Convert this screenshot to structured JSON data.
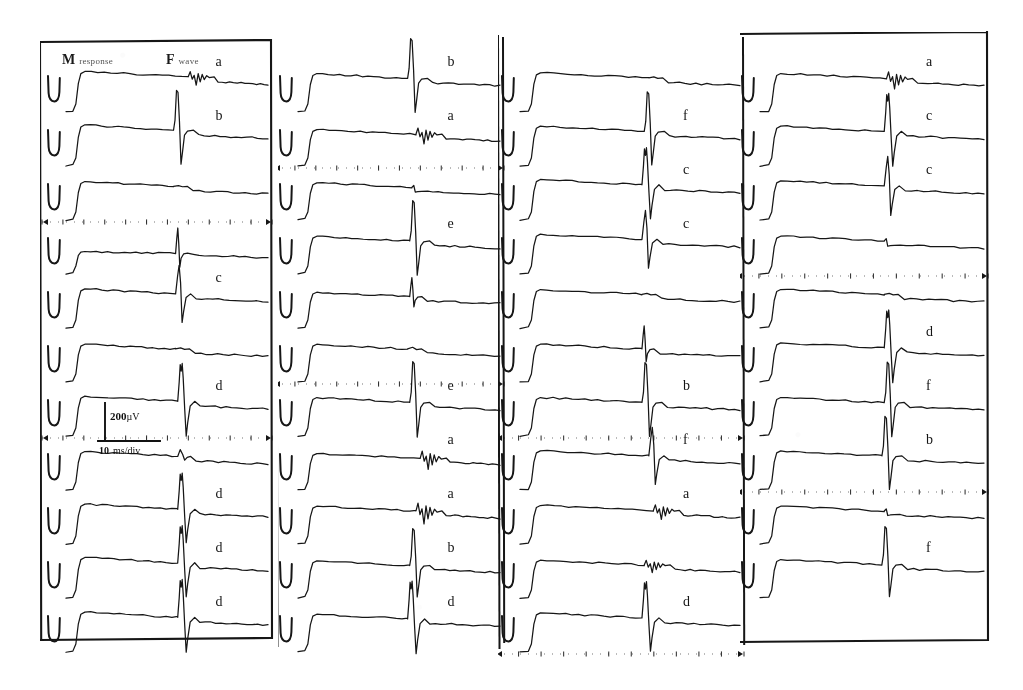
{
  "figure": {
    "background_color": "#ffffff",
    "trace_color": "#161616",
    "width": 1023,
    "height": 690
  },
  "header": {
    "m_label_bold": "M",
    "m_label_small": "response",
    "f_label_bold": "F",
    "f_label_small": "wave"
  },
  "calibration": {
    "vertical_value": "200",
    "vertical_unit": "µV",
    "horizontal_value": "10",
    "horizontal_unit": "ms/div"
  },
  "chart_data": {
    "type": "line",
    "subtitle": "Four panels of stacked surface EMG sweeps; each sweep shows a stimulus artifact, an M response plateau and a later F wave deflection.",
    "xlabel": "Time",
    "ylabel": "Amplitude",
    "xunit": "ms",
    "yunit": "µV",
    "x_scale_per_div": 10,
    "y_scale_bar": 200,
    "grid": "dotted-timebase-rows",
    "legend": "none",
    "annotations": [
      "M response",
      "F wave"
    ],
    "panels": [
      {
        "index": 1,
        "border": "full-box",
        "n_traces": 11,
        "timebase_rows": [
          2,
          6
        ],
        "traces": [
          {
            "label": "a",
            "f_wave": "polyphasic-small",
            "f_amp": 0.22,
            "f_pos": 0.62,
            "m_amp": 0.78
          },
          {
            "label": "b",
            "f_wave": "large-biphasic",
            "f_amp": 0.95,
            "f_pos": 0.55,
            "m_amp": 0.8
          },
          {
            "label": "",
            "f_wave": "flat",
            "f_amp": 0.04,
            "f_pos": 0.55,
            "m_amp": 0.72
          },
          {
            "label": "",
            "f_wave": "spike-narrow",
            "f_amp": 0.6,
            "f_pos": 0.56,
            "m_amp": 0.25
          },
          {
            "label": "c",
            "f_wave": "biphasic",
            "f_amp": 0.85,
            "f_pos": 0.56,
            "m_amp": 0.74
          },
          {
            "label": "",
            "f_wave": "flat",
            "f_amp": 0.05,
            "f_pos": 0.56,
            "m_amp": 0.7
          },
          {
            "label": "d",
            "f_wave": "notched-biphasic",
            "f_amp": 0.92,
            "f_pos": 0.57,
            "m_amp": 0.76
          },
          {
            "label": "",
            "f_wave": "small-bump",
            "f_amp": 0.18,
            "f_pos": 0.57,
            "m_amp": 0.72
          },
          {
            "label": "d",
            "f_wave": "notched-biphasic",
            "f_amp": 0.88,
            "f_pos": 0.57,
            "m_amp": 0.76
          },
          {
            "label": "d",
            "f_wave": "notched-biphasic",
            "f_amp": 0.9,
            "f_pos": 0.57,
            "m_amp": 0.78
          },
          {
            "label": "d",
            "f_wave": "notched-biphasic",
            "f_amp": 0.92,
            "f_pos": 0.57,
            "m_amp": 0.76
          }
        ]
      },
      {
        "index": 2,
        "border": "left-right-rules",
        "n_traces": 11,
        "timebase_rows": [
          1,
          5
        ],
        "traces": [
          {
            "label": "b",
            "f_wave": "large-biphasic",
            "f_amp": 0.95,
            "f_pos": 0.56,
            "m_amp": 0.72
          },
          {
            "label": "a",
            "f_wave": "polyphasic-small",
            "f_amp": 0.26,
            "f_pos": 0.6,
            "m_amp": 0.66
          },
          {
            "label": "",
            "f_wave": "step-down",
            "f_amp": 0.12,
            "f_pos": 0.58,
            "m_amp": 0.68
          },
          {
            "label": "e",
            "f_wave": "large-biphasic",
            "f_amp": 0.96,
            "f_pos": 0.57,
            "m_amp": 0.7
          },
          {
            "label": "",
            "f_wave": "spike-narrow",
            "f_amp": 0.45,
            "f_pos": 0.57,
            "m_amp": 0.64
          },
          {
            "label": "",
            "f_wave": "flat",
            "f_amp": 0.08,
            "f_pos": 0.56,
            "m_amp": 0.7
          },
          {
            "label": "e",
            "f_wave": "large-biphasic",
            "f_amp": 0.97,
            "f_pos": 0.57,
            "m_amp": 0.72
          },
          {
            "label": "a",
            "f_wave": "polyphasic-small",
            "f_amp": 0.3,
            "f_pos": 0.62,
            "m_amp": 0.66
          },
          {
            "label": "a",
            "f_wave": "polyphasic-small",
            "f_amp": 0.34,
            "f_pos": 0.6,
            "m_amp": 0.7
          },
          {
            "label": "b",
            "f_wave": "large-biphasic",
            "f_amp": 0.88,
            "f_pos": 0.57,
            "m_amp": 0.68
          },
          {
            "label": "d",
            "f_wave": "notched-biphasic",
            "f_amp": 0.92,
            "f_pos": 0.56,
            "m_amp": 0.7
          }
        ]
      },
      {
        "index": 3,
        "border": "left-right-rules",
        "n_traces": 11,
        "timebase_rows": [
          6,
          10
        ],
        "traces": [
          {
            "label": "",
            "f_wave": "flat",
            "f_amp": 0.05,
            "f_pos": 0.6,
            "m_amp": 0.74
          },
          {
            "label": "f",
            "f_wave": "large-biphasic",
            "f_amp": 0.94,
            "f_pos": 0.58,
            "m_amp": 0.76
          },
          {
            "label": "c",
            "f_wave": "notched-biphasic",
            "f_amp": 0.9,
            "f_pos": 0.57,
            "m_amp": 0.78
          },
          {
            "label": "c",
            "f_wave": "biphasic",
            "f_amp": 0.86,
            "f_pos": 0.57,
            "m_amp": 0.76
          },
          {
            "label": "",
            "f_wave": "flat",
            "f_amp": 0.05,
            "f_pos": 0.57,
            "m_amp": 0.72
          },
          {
            "label": "",
            "f_wave": "spike-narrow",
            "f_amp": 0.55,
            "f_pos": 0.57,
            "m_amp": 0.7
          },
          {
            "label": "b",
            "f_wave": "large-biphasic",
            "f_amp": 0.95,
            "f_pos": 0.57,
            "m_amp": 0.72
          },
          {
            "label": "f",
            "f_wave": "biphasic",
            "f_amp": 0.85,
            "f_pos": 0.6,
            "m_amp": 0.74
          },
          {
            "label": "a",
            "f_wave": "polyphasic-small",
            "f_amp": 0.24,
            "f_pos": 0.62,
            "m_amp": 0.72
          },
          {
            "label": "",
            "f_wave": "polyphasic-small",
            "f_amp": 0.2,
            "f_pos": 0.58,
            "m_amp": 0.7
          },
          {
            "label": "d",
            "f_wave": "notched-biphasic",
            "f_amp": 0.88,
            "f_pos": 0.57,
            "m_amp": 0.74
          }
        ]
      },
      {
        "index": 4,
        "border": "full-box",
        "n_traces": 11,
        "timebase_rows": [
          3,
          7
        ],
        "traces": [
          {
            "label": "a",
            "f_wave": "polyphasic-small",
            "f_amp": 0.28,
            "f_pos": 0.58,
            "m_amp": 0.72
          },
          {
            "label": "c",
            "f_wave": "notched-biphasic",
            "f_amp": 0.92,
            "f_pos": 0.57,
            "m_amp": 0.76
          },
          {
            "label": "c",
            "f_wave": "biphasic",
            "f_amp": 0.88,
            "f_pos": 0.57,
            "m_amp": 0.74
          },
          {
            "label": "",
            "f_wave": "step-down",
            "f_amp": 0.14,
            "f_pos": 0.57,
            "m_amp": 0.7
          },
          {
            "label": "",
            "f_wave": "flat",
            "f_amp": 0.05,
            "f_pos": 0.57,
            "m_amp": 0.72
          },
          {
            "label": "d",
            "f_wave": "notched-biphasic",
            "f_amp": 0.92,
            "f_pos": 0.57,
            "m_amp": 0.74
          },
          {
            "label": "f",
            "f_wave": "large-biphasic",
            "f_amp": 0.96,
            "f_pos": 0.57,
            "m_amp": 0.72
          },
          {
            "label": "b",
            "f_wave": "large-biphasic",
            "f_amp": 0.94,
            "f_pos": 0.56,
            "m_amp": 0.74
          },
          {
            "label": "",
            "f_wave": "step-down",
            "f_amp": 0.12,
            "f_pos": 0.57,
            "m_amp": 0.7
          },
          {
            "label": "f",
            "f_wave": "large-biphasic",
            "f_amp": 0.9,
            "f_pos": 0.56,
            "m_amp": 0.72
          }
        ]
      }
    ]
  }
}
